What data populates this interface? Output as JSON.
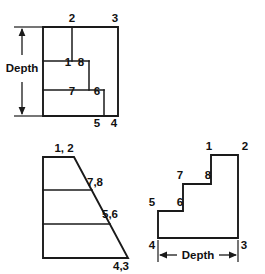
{
  "figure": {
    "background_color": "#ffffff",
    "line_color": "#1a1a1a",
    "text_color": "#111111"
  },
  "views": {
    "top_view": {
      "name": "top-view",
      "dimension_label": "Depth",
      "vertex_labels": [
        {
          "text": "2",
          "x": 72,
          "y": 22
        },
        {
          "text": "3",
          "x": 115,
          "y": 22
        },
        {
          "text": "1",
          "x": 68,
          "y": 66
        },
        {
          "text": "8",
          "x": 80,
          "y": 66
        },
        {
          "text": "7",
          "x": 72,
          "y": 95
        },
        {
          "text": "6",
          "x": 97,
          "y": 95
        },
        {
          "text": "5",
          "x": 97,
          "y": 123
        },
        {
          "text": "4",
          "x": 114,
          "y": 123
        }
      ]
    },
    "side_view": {
      "name": "side-view",
      "vertex_labels": [
        {
          "text": "1, 2",
          "x": 62,
          "y": 152
        },
        {
          "text": "7,8",
          "x": 90,
          "y": 182
        },
        {
          "text": "5,6",
          "x": 103,
          "y": 214
        },
        {
          "text": "4,3",
          "x": 112,
          "y": 266
        }
      ]
    },
    "front_view": {
      "name": "front-view",
      "dimension_label": "Depth",
      "vertex_labels": [
        {
          "text": "1",
          "x": 208,
          "y": 150
        },
        {
          "text": "2",
          "x": 243,
          "y": 150
        },
        {
          "text": "7",
          "x": 178,
          "y": 179
        },
        {
          "text": "8",
          "x": 208,
          "y": 179
        },
        {
          "text": "5",
          "x": 152,
          "y": 206
        },
        {
          "text": "6",
          "x": 178,
          "y": 206
        },
        {
          "text": "4",
          "x": 152,
          "y": 245
        },
        {
          "text": "3",
          "x": 243,
          "y": 245
        }
      ]
    }
  },
  "geometry": {
    "top_view": {
      "outer_rect": "M 43,27 L 118,27 L 118,116 L 43,116 Z",
      "step_line_upper": "M 43,61 L 89,61",
      "step_line_lower": "M 43,90 L 104,90",
      "vertical_mid": "M 72,27 L 72,61",
      "vertical_step_1": "M 89,61 L 89,90",
      "vertical_step_2": "M 104,90 L 104,116",
      "depth_dim_x": 22,
      "depth_ext_top_y": 27,
      "depth_ext_bottom_y": 116
    },
    "side_view": {
      "outline": "M 43,157 L 74,157 L 128,258 L 43,258 Z",
      "divider_1": "M 43,190 L 92,190",
      "divider_2": "M 43,224 L 110,224"
    },
    "front_view": {
      "outline": "M 158,211 L 158,238 L 238,238 L 238,155 L 211,155 L 211,184 L 183,184 L 183,211 Z",
      "dim_y": 255,
      "dim_x_left": 158,
      "dim_x_right": 238
    }
  }
}
